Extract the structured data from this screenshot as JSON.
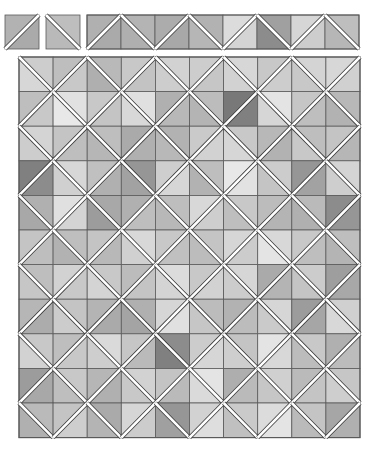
{
  "figure": {
    "type": "quilt-layout",
    "background": "#ffffff",
    "cell_border_color": "#5a5a5a",
    "sash_color": "#ffffff",
    "sash_outline_color": "#3a3a3a"
  },
  "legend_blocks": [
    {
      "x": 5,
      "y": 15,
      "size": 34,
      "dir": "/",
      "shades": [
        178,
        170
      ]
    },
    {
      "x": 46,
      "y": 15,
      "size": 34,
      "dir": "\\",
      "shades": [
        190,
        185
      ]
    }
  ],
  "strip": {
    "x": 87,
    "y": 15,
    "cell": 34,
    "count": 8,
    "cells": [
      {
        "dir": "/",
        "shades": [
          176,
          170
        ]
      },
      {
        "dir": "\\",
        "shades": [
          180,
          175
        ]
      },
      {
        "dir": "/",
        "shades": [
          172,
          168
        ]
      },
      {
        "dir": "\\",
        "shades": [
          178,
          182
        ]
      },
      {
        "dir": "/",
        "shades": [
          220,
          212
        ]
      },
      {
        "dir": "\\",
        "shades": [
          160,
          140
        ]
      },
      {
        "dir": "/",
        "shades": [
          214,
          205
        ]
      },
      {
        "dir": "\\",
        "shades": [
          190,
          182
        ]
      }
    ]
  },
  "grid": {
    "x": 19,
    "y": 57,
    "cols": 10,
    "rows": 11,
    "cell_w": 34.1,
    "cell_h": 34.6,
    "rule": "diagonal '\\' when (row+col) even, '/' when odd; shades = [top triangle, bottom triangle]",
    "cells": [
      [
        [
          205,
          215
        ],
        [
          190,
          200
        ],
        [
          185,
          175
        ],
        [
          200,
          195
        ],
        [
          210,
          205
        ],
        [
          205,
          198
        ],
        [
          215,
          210
        ],
        [
          200,
          205
        ],
        [
          212,
          200
        ],
        [
          215,
          208
        ]
      ],
      [
        [
          190,
          200
        ],
        [
          225,
          232
        ],
        [
          200,
          196
        ],
        [
          224,
          216
        ],
        [
          176,
          184
        ],
        [
          188,
          180
        ],
        [
          120,
          128
        ],
        [
          228,
          214
        ],
        [
          198,
          190
        ],
        [
          184,
          178
        ]
      ],
      [
        [
          212,
          205
        ],
        [
          196,
          190
        ],
        [
          190,
          182
        ],
        [
          170,
          176
        ],
        [
          178,
          184
        ],
        [
          202,
          210
        ],
        [
          200,
          214
        ],
        [
          184,
          178
        ],
        [
          190,
          200
        ],
        [
          196,
          182
        ]
      ],
      [
        [
          128,
          140
        ],
        [
          215,
          208
        ],
        [
          192,
          176
        ],
        [
          150,
          162
        ],
        [
          206,
          214
        ],
        [
          190,
          178
        ],
        [
          232,
          226
        ],
        [
          204,
          196
        ],
        [
          150,
          162
        ],
        [
          212,
          206
        ]
      ],
      [
        [
          176,
          168
        ],
        [
          224,
          212
        ],
        [
          168,
          156
        ],
        [
          176,
          190
        ],
        [
          190,
          184
        ],
        [
          216,
          206
        ],
        [
          200,
          190
        ],
        [
          188,
          180
        ],
        [
          186,
          176
        ],
        [
          140,
          150
        ]
      ],
      [
        [
          196,
          190
        ],
        [
          190,
          178
        ],
        [
          196,
          184
        ],
        [
          216,
          208
        ],
        [
          200,
          192
        ],
        [
          196,
          188
        ],
        [
          214,
          204
        ],
        [
          216,
          228
        ],
        [
          200,
          190
        ],
        [
          190,
          180
        ]
      ],
      [
        [
          190,
          198
        ],
        [
          210,
          200
        ],
        [
          200,
          212
        ],
        [
          188,
          196
        ],
        [
          220,
          212
        ],
        [
          200,
          210
        ],
        [
          214,
          204
        ],
        [
          170,
          180
        ],
        [
          204,
          196
        ],
        [
          158,
          168
        ]
      ],
      [
        [
          182,
          172
        ],
        [
          196,
          204
        ],
        [
          180,
          170
        ],
        [
          176,
          164
        ],
        [
          214,
          224
        ],
        [
          188,
          198
        ],
        [
          178,
          188
        ],
        [
          214,
          202
        ],
        [
          156,
          166
        ],
        [
          208,
          216
        ]
      ],
      [
        [
          200,
          210
        ],
        [
          190,
          200
        ],
        [
          218,
          206
        ],
        [
          198,
          186
        ],
        [
          140,
          128
        ],
        [
          204,
          214
        ],
        [
          196,
          206
        ],
        [
          228,
          216
        ],
        [
          200,
          188
        ],
        [
          176,
          188
        ]
      ],
      [
        [
          156,
          168
        ],
        [
          200,
          190
        ],
        [
          182,
          176
        ],
        [
          210,
          200
        ],
        [
          196,
          186
        ],
        [
          228,
          218
        ],
        [
          174,
          186
        ],
        [
          208,
          198
        ],
        [
          186,
          196
        ],
        [
          198,
          206
        ]
      ],
      [
        [
          186,
          176
        ],
        [
          196,
          206
        ],
        [
          170,
          180
        ],
        [
          214,
          204
        ],
        [
          150,
          160
        ],
        [
          210,
          222
        ],
        [
          202,
          192
        ],
        [
          220,
          228
        ],
        [
          196,
          186
        ],
        [
          166,
          176
        ]
      ]
    ]
  }
}
